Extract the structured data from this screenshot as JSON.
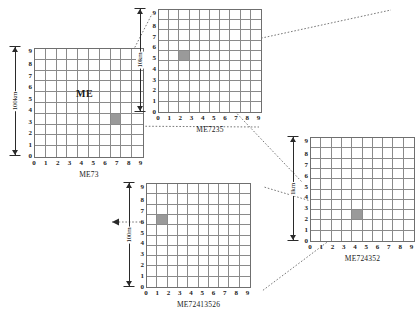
{
  "figure": {
    "type": "hierarchical-grid-reference-diagram",
    "inner_label": "ME",
    "highlight_color": "#9a9a9a",
    "grid_line_color": "#8a8a8a",
    "tick_labels_x": [
      "0",
      "1",
      "2",
      "3",
      "4",
      "5",
      "6",
      "7",
      "8",
      "9"
    ],
    "tick_labels_y": [
      "9",
      "8",
      "7",
      "6",
      "5",
      "4",
      "3",
      "2",
      "1",
      "0"
    ]
  },
  "grids": [
    {
      "id": "grid-me73",
      "caption": "ME73",
      "scale_label": "100km",
      "cell_size": "100km",
      "highlight": {
        "x": 7,
        "y": 3
      },
      "xticks": [
        "0",
        "1",
        "2",
        "3",
        "4",
        "5",
        "6",
        "7",
        "8",
        "9"
      ],
      "yticks": [
        "9",
        "8",
        "7",
        "6",
        "5",
        "4",
        "3",
        "2",
        "1",
        "0"
      ]
    },
    {
      "id": "grid-me7235",
      "caption": "ME7235",
      "scale_label": "10km",
      "cell_size": "10km",
      "highlight": {
        "x": 2,
        "y": 5
      },
      "xticks": [
        "0",
        "1",
        "2",
        "3",
        "4",
        "5",
        "6",
        "7",
        "8",
        "9"
      ],
      "yticks": [
        "9",
        "8",
        "7",
        "6",
        "5",
        "4",
        "3",
        "2",
        "1",
        "0"
      ]
    },
    {
      "id": "grid-me724352",
      "caption": "ME724352",
      "scale_label": "1km",
      "cell_size": "1km",
      "highlight": {
        "x": 4,
        "y": 2
      },
      "xticks": [
        "0",
        "1",
        "2",
        "3",
        "4",
        "5",
        "6",
        "7",
        "8",
        "9"
      ],
      "yticks": [
        "9",
        "8",
        "7",
        "6",
        "5",
        "4",
        "3",
        "2",
        "1",
        "0"
      ]
    },
    {
      "id": "grid-me72413526",
      "caption": "ME72413526",
      "scale_label": "100m",
      "cell_size": "100m",
      "highlight": {
        "x": 1,
        "y": 6
      },
      "xticks": [
        "0",
        "1",
        "2",
        "3",
        "4",
        "5",
        "6",
        "7",
        "8",
        "9"
      ],
      "yticks": [
        "9",
        "8",
        "7",
        "6",
        "5",
        "4",
        "3",
        "2",
        "1",
        "0"
      ]
    }
  ]
}
